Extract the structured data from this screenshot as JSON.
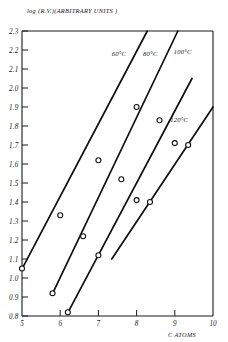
{
  "chart_data": {
    "type": "line",
    "title": "log (R.V.)(ARBITRARY UNITS )",
    "xlabel": "C ATOMS",
    "ylabel": "log (R.V.)(ARBITRARY UNITS )",
    "xlim": [
      5,
      10
    ],
    "ylim": [
      0.8,
      2.3
    ],
    "grid": false,
    "legend_position": "inline-on-curves",
    "x_ticks": [
      "5",
      "6",
      "7",
      "8",
      "9",
      "10"
    ],
    "y_ticks": [
      "0.8",
      "0.9",
      "1.0",
      "1.1",
      "1.2",
      "1.3",
      "1.4",
      "1.5",
      "1.6",
      "1.7",
      "1.8",
      "1.9",
      "2.0",
      "2.1",
      "2.2",
      "2.3"
    ],
    "marker": "open-circle",
    "series": [
      {
        "name": "60°C",
        "label": "60°C",
        "label_x": 7.35,
        "label_y": 2.17,
        "x": [
          5.0,
          6.0,
          7.0,
          8.0
        ],
        "y": [
          1.05,
          1.33,
          1.62,
          1.9
        ],
        "line_x": [
          4.98,
          8.28
        ],
        "line_y": [
          1.04,
          2.3
        ]
      },
      {
        "name": "80°C",
        "label": "80°C",
        "label_x": 8.17,
        "label_y": 2.17,
        "x": [
          5.8,
          6.6,
          7.6,
          8.6
        ],
        "y": [
          0.92,
          1.22,
          1.52,
          1.83
        ],
        "line_x": [
          5.78,
          9.08
        ],
        "line_y": [
          0.91,
          2.3
        ]
      },
      {
        "name": "100°C",
        "label": "100°C",
        "label_x": 8.97,
        "label_y": 2.18,
        "x": [
          6.2,
          7.0,
          8.0,
          9.0
        ],
        "y": [
          0.82,
          1.12,
          1.41,
          1.71
        ],
        "line_x": [
          6.18,
          9.45
        ],
        "line_y": [
          0.81,
          2.05
        ]
      },
      {
        "name": "120°C",
        "label": "120°C",
        "label_x": 8.88,
        "label_y": 1.82,
        "x": [
          8.35,
          9.35
        ],
        "y": [
          1.4,
          1.7
        ],
        "line_x": [
          7.35,
          10.0
        ],
        "line_y": [
          1.1,
          1.9
        ]
      }
    ]
  }
}
